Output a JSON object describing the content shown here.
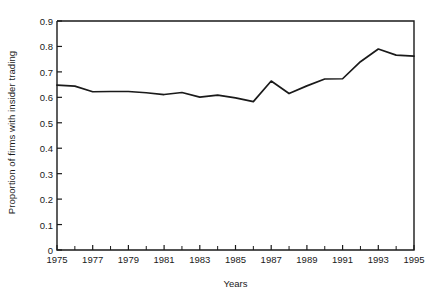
{
  "chart_data": {
    "type": "line",
    "title": "",
    "xlabel": "Years",
    "ylabel": "Proportion of firms with insider trading",
    "xlim": [
      1975,
      1995
    ],
    "ylim": [
      0,
      0.9
    ],
    "grid": false,
    "legend": null,
    "ytick_labels": [
      "0",
      "0.1",
      "0.2",
      "0.3",
      "0.4",
      "0.5",
      "0.6",
      "0.7",
      "0.8",
      "0.9"
    ],
    "ytick_values": [
      0,
      0.1,
      0.2,
      0.3,
      0.4,
      0.5,
      0.6,
      0.7,
      0.8,
      0.9
    ],
    "xtick_labels": [
      "1975",
      "1977",
      "1979",
      "1981",
      "1983",
      "1985",
      "1987",
      "1989",
      "1991",
      "1993",
      "1995"
    ],
    "xtick_values": [
      1975,
      1977,
      1979,
      1981,
      1983,
      1985,
      1987,
      1989,
      1991,
      1993,
      1995
    ],
    "xminor_values": [
      1976,
      1978,
      1980,
      1982,
      1984,
      1986,
      1988,
      1990,
      1992,
      1994
    ],
    "line_color": "#1a1a1a",
    "x": [
      1975,
      1976,
      1977,
      1978,
      1979,
      1980,
      1981,
      1982,
      1983,
      1984,
      1985,
      1986,
      1987,
      1988,
      1989,
      1990,
      1991,
      1992,
      1993,
      1994,
      1995
    ],
    "values": [
      0.648,
      0.644,
      0.622,
      0.623,
      0.623,
      0.618,
      0.611,
      0.619,
      0.601,
      0.609,
      0.598,
      0.583,
      0.664,
      0.615,
      0.645,
      0.672,
      0.673,
      0.74,
      0.79,
      0.766,
      0.762
    ],
    "series": [
      {
        "name": "Proportion of firms with insider trading",
        "values": [
          0.648,
          0.644,
          0.622,
          0.623,
          0.623,
          0.618,
          0.611,
          0.619,
          0.601,
          0.609,
          0.598,
          0.583,
          0.664,
          0.615,
          0.645,
          0.672,
          0.673,
          0.74,
          0.79,
          0.766,
          0.762
        ]
      }
    ]
  },
  "axes": {
    "ylabel": "Proportion of firms with insider trading",
    "xlabel": "Years"
  }
}
